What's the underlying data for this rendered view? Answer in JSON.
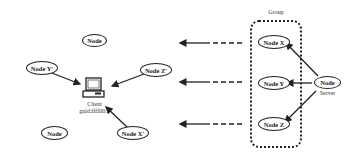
{
  "group": {
    "label": "Group"
  },
  "nodes": {
    "top_node": "Node",
    "node_y_prime": "Node Y'",
    "node_z_prime": "Node Z'",
    "node_x_prime": "Node X'",
    "bottom_node": "Node",
    "node_x": "Node X",
    "node_y": "Node Y",
    "node_z": "Node Z",
    "server_node": "Node"
  },
  "client": {
    "line1": "Client",
    "line2": "guid:ffff00..."
  },
  "server": {
    "label": "Server"
  },
  "colors": {
    "stroke": "#222222",
    "background": "#ffffff"
  }
}
